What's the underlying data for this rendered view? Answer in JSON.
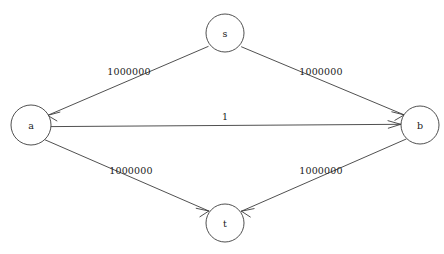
{
  "diagram": {
    "type": "directed-graph",
    "width": 444,
    "height": 254,
    "background_color": "#ffffff",
    "stroke_color": "#3c3c3c",
    "text_color": "#1a1a1a",
    "nodes": [
      {
        "id": "s",
        "label": "s",
        "cx": 225,
        "cy": 33,
        "r": 19
      },
      {
        "id": "a",
        "label": "a",
        "cx": 31,
        "cy": 125,
        "r": 20
      },
      {
        "id": "b",
        "label": "b",
        "cx": 420,
        "cy": 125,
        "r": 19
      },
      {
        "id": "t",
        "label": "t",
        "cx": 225,
        "cy": 223,
        "r": 19
      }
    ],
    "edges": [
      {
        "from": "s",
        "to": "a",
        "label": "1000000",
        "label_x": 129,
        "label_y": 71
      },
      {
        "from": "s",
        "to": "b",
        "label": "1000000",
        "label_x": 321,
        "label_y": 71
      },
      {
        "from": "a",
        "to": "b",
        "label": "1",
        "label_x": 225,
        "label_y": 116
      },
      {
        "from": "a",
        "to": "t",
        "label": "1000000",
        "label_x": 131,
        "label_y": 170
      },
      {
        "from": "b",
        "to": "t",
        "label": "1000000",
        "label_x": 321,
        "label_y": 170
      }
    ]
  }
}
